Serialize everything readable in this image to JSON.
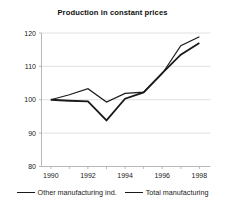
{
  "chart_data": {
    "type": "line",
    "title": "Production in constant prices",
    "xlabel": "",
    "ylabel": "",
    "x": [
      1990,
      1991,
      1992,
      1993,
      1994,
      1995,
      1996,
      1997,
      1998
    ],
    "xtick_labels": [
      "1990",
      "1992",
      "1994",
      "1996",
      "1998"
    ],
    "xticks": [
      1990,
      1992,
      1994,
      1996,
      1998
    ],
    "ytick_labels": [
      "80",
      "90",
      "100",
      "110",
      "120"
    ],
    "yticks": [
      80,
      90,
      100,
      110,
      120
    ],
    "xlim": [
      1989.5,
      1998.6
    ],
    "ylim": [
      80,
      120
    ],
    "grid": "horizontal",
    "legend_position": "bottom",
    "series": [
      {
        "name": "Other manufacturing ind.",
        "color": "#1a1a1a",
        "width": 1.2,
        "values": [
          100.0,
          101.5,
          103.3,
          99.3,
          101.9,
          102.3,
          107.8,
          116.2,
          118.9
        ]
      },
      {
        "name": "Total manufacturing",
        "color": "#1a1a1a",
        "width": 1.8,
        "values": [
          100.0,
          99.7,
          99.5,
          93.8,
          100.3,
          102.2,
          108.0,
          113.5,
          117.0
        ]
      }
    ]
  },
  "legend": {
    "entries": [
      {
        "label": "Other manufacturing ind."
      },
      {
        "label": "Total manufacturing"
      }
    ]
  }
}
